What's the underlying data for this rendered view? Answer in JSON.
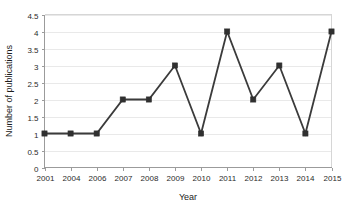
{
  "chart_data": {
    "type": "line",
    "title": "",
    "xlabel": "Year",
    "ylabel": "Number of publications",
    "categories": [
      "2001",
      "2004",
      "2006",
      "2007",
      "2008",
      "2009",
      "2010",
      "2011",
      "2012",
      "2013",
      "2014",
      "2015"
    ],
    "values": [
      1,
      1,
      1,
      2,
      2,
      3,
      1,
      4,
      2,
      3,
      1,
      4
    ],
    "series": [
      {
        "name": "Number of publications",
        "values": [
          1,
          1,
          1,
          2,
          2,
          3,
          1,
          4,
          2,
          3,
          1,
          4
        ]
      }
    ],
    "ylim": [
      0,
      4.5
    ],
    "ytick_labels": [
      "0",
      "0.5",
      "1",
      "1.5",
      "2",
      "2.5",
      "3",
      "3.5",
      "4",
      "4.5"
    ],
    "ytick_values": [
      0,
      0.5,
      1,
      1.5,
      2,
      2.5,
      3,
      3.5,
      4,
      4.5
    ],
    "xtick_labels": [
      "2001",
      "2004",
      "2006",
      "2007",
      "2008",
      "2009",
      "2010",
      "2011",
      "2012",
      "2013",
      "2014",
      "2015"
    ],
    "grid": true,
    "grid_axis": "y",
    "legend": false,
    "legend_position": "none",
    "marker": "square",
    "line_color": "#3b3b3b",
    "marker_color": "#303030",
    "grid_color": "#e9e9e9",
    "axis_color": "#9b9b9b",
    "background_color": "#ffffff"
  }
}
